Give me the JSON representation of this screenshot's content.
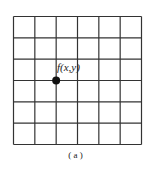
{
  "diagram": {
    "type": "pixel-grid",
    "grid": {
      "rows": 6,
      "cols": 6,
      "line_color": "#333333"
    },
    "point": {
      "label": "f(x,y)",
      "grid_col": 2,
      "grid_row": 3,
      "color": "#111111"
    },
    "caption": "( a )"
  }
}
